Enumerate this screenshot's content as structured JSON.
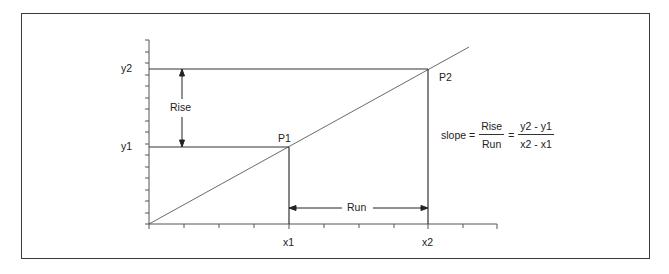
{
  "diagram": {
    "colors": {
      "line": "#333333",
      "axis": "#555555",
      "frame": "#3a3a3a",
      "text": "#222222"
    },
    "axis_labels": {
      "y2": "y2",
      "y1": "y1",
      "x1": "x1",
      "x2": "x2"
    },
    "points": {
      "p1": "P1",
      "p2": "P2"
    },
    "annotations": {
      "rise": "Rise",
      "run": "Run"
    },
    "formula": {
      "lhs": "slope =",
      "frac1_num": "Rise",
      "frac1_den": "Run",
      "eq": "=",
      "frac2_num": "y2 - y1",
      "frac2_den": "x2 - x1"
    }
  }
}
